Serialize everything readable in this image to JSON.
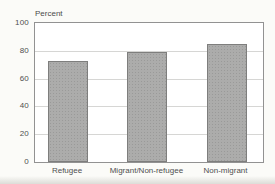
{
  "chart_data": {
    "type": "bar",
    "categories": [
      "Refugee",
      "Migrant/Non-refugee",
      "Non-migrant"
    ],
    "values": [
      73,
      79,
      85
    ],
    "title": "",
    "xlabel": "",
    "ylabel": "Percent",
    "ylim": [
      0,
      100
    ],
    "yticks": [
      0,
      20,
      40,
      60,
      80,
      100
    ],
    "grid": true,
    "legend": false,
    "colors": {
      "bar_fill": "#acacab",
      "bar_border": "#7e7e7d",
      "gridline": "#d6d6d4",
      "axis_frame": "#929292",
      "text": "#4b4b4b",
      "plot_background": "#ffffff",
      "page_background": "#fbfbf8"
    }
  }
}
